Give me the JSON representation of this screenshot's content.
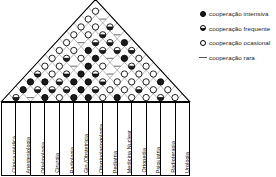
{
  "diagram": {
    "type": "house-of-quality-correlation-roof",
    "title": "",
    "columns": [
      "Clínica médica",
      "Anestesiologia",
      "Oftalmologia",
      "Cirurgia",
      "Radiologia",
      "Gin./Obstetrícia",
      "Otorrinolaringologia",
      "Pediatria",
      "Medicina Nuclear",
      "Ortopedia",
      "Psiquiatria",
      "Radioterapia",
      "Urologia"
    ],
    "symbol_values": {
      "full": "cooperação intensiva",
      "half": "cooperação frequente",
      "empty": "cooperação ocasional",
      "dash": "cooperação rara"
    },
    "rows": [
      [
        "half",
        "dash",
        "full",
        "empty",
        "full",
        "full",
        "empty",
        "full",
        "empty",
        "empty",
        "half",
        "empty"
      ],
      [
        "full",
        "half",
        "half",
        "half",
        "full",
        "half",
        "empty",
        "empty",
        "half",
        "empty",
        "empty"
      ],
      [
        "full",
        "full",
        "half",
        "full",
        "full",
        "half",
        "empty",
        "empty",
        "empty",
        "full"
      ],
      [
        "half",
        "empty",
        "half",
        "full",
        "half",
        "dash",
        "empty",
        "empty",
        "empty"
      ],
      [
        "empty",
        "empty",
        "dash",
        "full",
        "empty",
        "dash",
        "half",
        "empty"
      ],
      [
        "empty",
        "half",
        "empty",
        "full",
        "dash",
        "full",
        "empty"
      ],
      [
        "empty",
        "empty",
        "full",
        "half",
        "half",
        "half"
      ],
      [
        "empty",
        "dash",
        "half",
        "half",
        "full"
      ],
      [
        "empty",
        "empty",
        "half",
        "dash"
      ],
      [
        "empty",
        "empty",
        "half"
      ],
      [
        "empty",
        "dash"
      ],
      [
        "empty"
      ]
    ]
  },
  "legend": {
    "items": [
      {
        "symbol": "full",
        "label": "cooperação intensiva"
      },
      {
        "symbol": "half",
        "label": "cooperação frequente"
      },
      {
        "symbol": "empty",
        "label": "cooperação ocasional"
      },
      {
        "symbol": "dash",
        "label": "cooperação rara"
      }
    ]
  },
  "colors": {
    "line": "#000000",
    "grid": "#8a8a8a",
    "fill": "#1a1a1a",
    "background": "#ffffff"
  }
}
